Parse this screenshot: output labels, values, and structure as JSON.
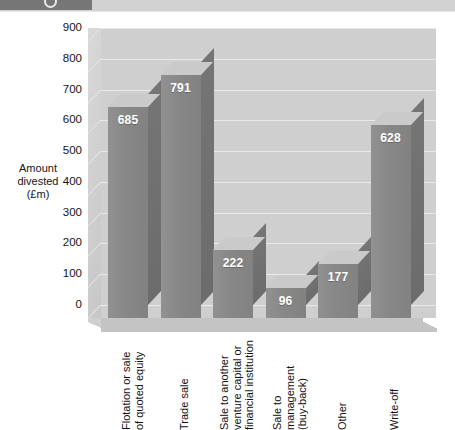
{
  "header": {
    "badge_glyph": "circle-number-icon",
    "title_fragment": "",
    "badge_color": "#767676",
    "strip_color": "#d2d2d2"
  },
  "chart_data": {
    "type": "bar",
    "title": "",
    "xlabel": "",
    "ylabel": "Amount divested (£m)",
    "ylabel_lines": [
      "Amount",
      "divested",
      "(£m)"
    ],
    "categories": [
      "Flotation or sale\nof quoted equity",
      "Trade sale",
      "Sale to another\nventure capital or\nfinancial institution",
      "Sale to\nmanagement\n(buy-back)",
      "Other",
      "Write-off"
    ],
    "values": [
      685,
      791,
      222,
      96,
      177,
      628
    ],
    "value_labels": [
      "685",
      "791",
      "222",
      "96",
      "177",
      "628"
    ],
    "ylim": [
      0,
      900
    ],
    "ytick_step": 100,
    "yticks": [
      "900",
      "800",
      "700",
      "600",
      "500",
      "400",
      "300",
      "200",
      "100",
      "0"
    ],
    "grid": true,
    "legend": "none",
    "style": "3d-column",
    "colors": {
      "bar_front": "#878787",
      "bar_side": "#6f6f6f",
      "bar_top": "#cacaca",
      "plot_background": "#cfcfcf",
      "gridline": "#e9e9e9",
      "value_label": "#ffffff",
      "axis_text": "#151515"
    }
  }
}
